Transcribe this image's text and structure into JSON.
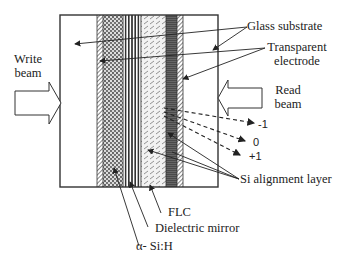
{
  "diagram": {
    "type": "optically addressed spatial light modulator cross-section",
    "labels": {
      "write_beam": [
        "Write",
        "beam"
      ],
      "read_beam": [
        "Read",
        "beam"
      ],
      "glass_substrate": "Glass substrate",
      "transparent_electrode": [
        "Transparent",
        "electrode"
      ],
      "si_alignment_layer": "Si alignment layer",
      "flc": "FLC",
      "dielectric_mirror": "Dielectric mirror",
      "a_si_h": "α- Si:H"
    },
    "diffraction_orders": [
      "-1",
      "0",
      "+1"
    ],
    "layers": [
      {
        "name": "glass-substrate-left",
        "pattern": "blank"
      },
      {
        "name": "transparent-electrode-left",
        "pattern": "diagonal-hatch"
      },
      {
        "name": "a-si-h",
        "pattern": "dotted"
      },
      {
        "name": "dielectric-mirror",
        "pattern": "vertical-stripes"
      },
      {
        "name": "flc",
        "pattern": "diagonal-dashes"
      },
      {
        "name": "si-alignment-layer",
        "pattern": "horizontal-dark"
      },
      {
        "name": "transparent-electrode-right",
        "pattern": "diagonal-hatch"
      },
      {
        "name": "glass-substrate-right",
        "pattern": "blank"
      }
    ],
    "colors": {
      "line": "#333333",
      "background": "#ffffff"
    }
  }
}
